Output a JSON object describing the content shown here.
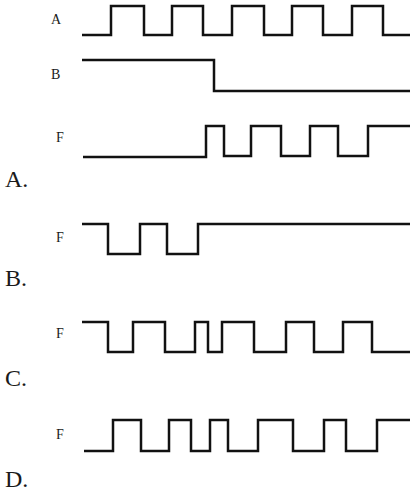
{
  "signals": {
    "A": {
      "label": "A",
      "high_y": 6,
      "low_y": 35,
      "points": [
        [
          82,
          35
        ],
        [
          111,
          35
        ],
        [
          111,
          6
        ],
        [
          144,
          6
        ],
        [
          144,
          35
        ],
        [
          172,
          35
        ],
        [
          172,
          6
        ],
        [
          203,
          6
        ],
        [
          203,
          35
        ],
        [
          232,
          35
        ],
        [
          232,
          6
        ],
        [
          264,
          6
        ],
        [
          264,
          35
        ],
        [
          292,
          35
        ],
        [
          292,
          6
        ],
        [
          323,
          6
        ],
        [
          323,
          35
        ],
        [
          352,
          35
        ],
        [
          352,
          6
        ],
        [
          383,
          6
        ],
        [
          383,
          35
        ],
        [
          410,
          35
        ]
      ]
    },
    "B": {
      "label": "B",
      "points": [
        [
          82,
          60
        ],
        [
          214,
          60
        ],
        [
          214,
          91
        ],
        [
          410,
          91
        ]
      ]
    }
  },
  "options": [
    {
      "letter": "A.",
      "f_label": "F",
      "points": [
        [
          83,
          157
        ],
        [
          206,
          157
        ],
        [
          206,
          126
        ],
        [
          224,
          126
        ],
        [
          224,
          156
        ],
        [
          251,
          156
        ],
        [
          251,
          126
        ],
        [
          281,
          126
        ],
        [
          281,
          156
        ],
        [
          310,
          156
        ],
        [
          310,
          126
        ],
        [
          338,
          126
        ],
        [
          338,
          156
        ],
        [
          368,
          156
        ],
        [
          368,
          126
        ],
        [
          410,
          126
        ]
      ]
    },
    {
      "letter": "B.",
      "f_label": "F",
      "points": [
        [
          82,
          224
        ],
        [
          108,
          224
        ],
        [
          108,
          254
        ],
        [
          140,
          254
        ],
        [
          140,
          224
        ],
        [
          167,
          224
        ],
        [
          167,
          254
        ],
        [
          198,
          254
        ],
        [
          198,
          224
        ],
        [
          410,
          224
        ]
      ]
    },
    {
      "letter": "C.",
      "f_label": "F",
      "points": [
        [
          82,
          322
        ],
        [
          108,
          322
        ],
        [
          108,
          352
        ],
        [
          133,
          352
        ],
        [
          133,
          322
        ],
        [
          165,
          322
        ],
        [
          165,
          352
        ],
        [
          195,
          352
        ],
        [
          195,
          322
        ],
        [
          208,
          322
        ],
        [
          208,
          352
        ],
        [
          222,
          352
        ],
        [
          222,
          322
        ],
        [
          254,
          322
        ],
        [
          254,
          352
        ],
        [
          286,
          352
        ],
        [
          286,
          322
        ],
        [
          314,
          322
        ],
        [
          314,
          352
        ],
        [
          343,
          352
        ],
        [
          343,
          322
        ],
        [
          372,
          322
        ],
        [
          372,
          352
        ],
        [
          410,
          352
        ]
      ]
    },
    {
      "letter": "D.",
      "f_label": "F",
      "points": [
        [
          84,
          451
        ],
        [
          113,
          451
        ],
        [
          113,
          420
        ],
        [
          141,
          420
        ],
        [
          141,
          451
        ],
        [
          169,
          451
        ],
        [
          169,
          420
        ],
        [
          191,
          420
        ],
        [
          191,
          451
        ],
        [
          210,
          451
        ],
        [
          210,
          420
        ],
        [
          228,
          420
        ],
        [
          228,
          451
        ],
        [
          258,
          451
        ],
        [
          258,
          420
        ],
        [
          293,
          420
        ],
        [
          293,
          451
        ],
        [
          324,
          451
        ],
        [
          324,
          420
        ],
        [
          346,
          420
        ],
        [
          346,
          451
        ],
        [
          377,
          451
        ],
        [
          377,
          420
        ],
        [
          410,
          420
        ]
      ]
    }
  ],
  "style": {
    "stroke": "#111111",
    "stroke_width": 2.5
  }
}
